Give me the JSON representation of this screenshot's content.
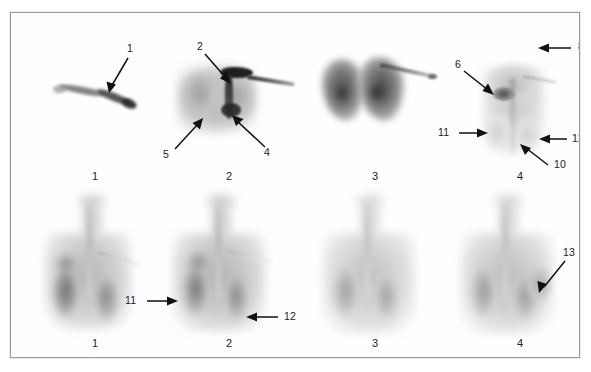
{
  "figure": {
    "type": "nuclear-medicine-scintigraphy-panel-figure",
    "rows": 2,
    "columns": 4,
    "background_color": "#ffffff",
    "frame_color": "#9a9a9a",
    "annotation_color": "#111111"
  },
  "top_row": {
    "caption_numbers": [
      "1",
      "2",
      "3",
      "4"
    ],
    "panels": [
      {
        "panel_number": "1",
        "description": "faint oblique linear uptake",
        "annotations": [
          {
            "label": "1",
            "arrow_direction": "down-left"
          }
        ]
      },
      {
        "panel_number": "2",
        "description": "thoracic uptake with intense central hot focus and linear catheter track",
        "annotations": [
          {
            "label": "2",
            "arrow_direction": "down-right"
          },
          {
            "label": "5",
            "arrow_direction": "up-right"
          },
          {
            "label": "4",
            "arrow_direction": "up-left"
          }
        ]
      },
      {
        "panel_number": "3",
        "description": "bilateral dense pulmonary uptake with faint catheter streak",
        "annotations": []
      },
      {
        "panel_number": "4",
        "description": "faint thoracic uptake, focal hot spot and midline vertical track",
        "annotations": [
          {
            "label": "8",
            "arrow_direction": "left"
          },
          {
            "label": "6",
            "arrow_direction": "down-right"
          },
          {
            "label": "11",
            "arrow_direction": "right"
          },
          {
            "label": "12",
            "arrow_direction": "left"
          },
          {
            "label": "10",
            "arrow_direction": "up-left"
          }
        ]
      }
    ]
  },
  "bottom_row": {
    "caption_numbers": [
      "1",
      "2",
      "3",
      "4"
    ],
    "panels": [
      {
        "panel_number": "1",
        "description": "whole-torso posterior view, mottled uptake, catheter streak to right",
        "annotations": []
      },
      {
        "panel_number": "2",
        "description": "whole-torso posterior view with annotated lateral foci",
        "annotations": [
          {
            "label": "11",
            "arrow_direction": "right"
          },
          {
            "label": "12",
            "arrow_direction": "left"
          }
        ]
      },
      {
        "panel_number": "3",
        "description": "whole-torso posterior view, diffuse uptake",
        "annotations": []
      },
      {
        "panel_number": "4",
        "description": "whole-torso posterior view with right lateral focus",
        "annotations": [
          {
            "label": "13",
            "arrow_direction": "down-left"
          }
        ]
      }
    ]
  },
  "labels": {
    "a1": "1",
    "a2": "2",
    "a4": "4",
    "a5": "5",
    "a6": "6",
    "a8": "8",
    "a10": "10",
    "a11": "11",
    "a12": "12",
    "b11": "11",
    "b12": "12",
    "b13": "13"
  },
  "panel_captions": {
    "top": {
      "p1": "1",
      "p2": "2",
      "p3": "3",
      "p4": "4"
    },
    "bottom": {
      "p1": "1",
      "p2": "2",
      "p3": "3",
      "p4": "4"
    }
  }
}
